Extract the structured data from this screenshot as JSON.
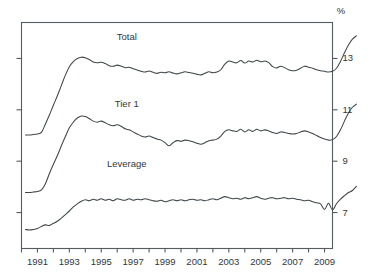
{
  "chart_data": {
    "type": "line",
    "title": "",
    "subtitle": "",
    "xlabel": "",
    "ylabel": "",
    "unit_label": "%",
    "ylim": [
      5.6,
      14.4
    ],
    "xlim": [
      1990.0,
      2009.5
    ],
    "grid": false,
    "legend_position": "inline-annotations",
    "y_ticks": [
      7,
      9,
      11,
      13
    ],
    "y_tick_labels": [
      "7",
      "9",
      "11",
      "13"
    ],
    "y_tick_side": "right",
    "x_ticks": [
      1991,
      1993,
      1995,
      1997,
      1999,
      2001,
      2003,
      2005,
      2007,
      2009
    ],
    "x_tick_labels": [
      "1991",
      "1993",
      "1995",
      "1997",
      "1999",
      "2001",
      "2003",
      "2005",
      "2007",
      "2009"
    ],
    "x_minor_ticks": [
      1990,
      1992,
      1994,
      1996,
      1998,
      2000,
      2002,
      2004,
      2006,
      2008
    ],
    "x_start": 1990.25,
    "x_step": 0.25,
    "series": [
      {
        "name": "Total",
        "label": "Total",
        "label_x": 1996.6,
        "label_y": 13.72,
        "color": "#404448",
        "values": [
          10.02,
          10.02,
          10.04,
          10.06,
          10.12,
          10.45,
          10.8,
          11.18,
          11.55,
          11.95,
          12.35,
          12.68,
          12.88,
          13.0,
          13.05,
          13.03,
          12.96,
          12.86,
          12.83,
          12.85,
          12.8,
          12.72,
          12.7,
          12.74,
          12.7,
          12.64,
          12.66,
          12.6,
          12.55,
          12.5,
          12.47,
          12.51,
          12.46,
          12.42,
          12.46,
          12.44,
          12.48,
          12.43,
          12.4,
          12.44,
          12.48,
          12.45,
          12.42,
          12.38,
          12.36,
          12.42,
          12.48,
          12.44,
          12.47,
          12.56,
          12.78,
          12.9,
          12.86,
          12.83,
          12.92,
          12.82,
          12.9,
          12.86,
          12.93,
          12.87,
          12.9,
          12.84,
          12.68,
          12.63,
          12.7,
          12.64,
          12.56,
          12.52,
          12.54,
          12.62,
          12.7,
          12.66,
          12.62,
          12.56,
          12.52,
          12.5,
          12.47,
          12.5,
          12.62,
          12.88,
          13.22,
          13.52,
          13.75,
          13.88
        ]
      },
      {
        "name": "Tier 1",
        "label": "Tier 1",
        "label_x": 1996.6,
        "label_y": 11.1,
        "color": "#404448",
        "values": [
          7.78,
          7.78,
          7.8,
          7.82,
          7.88,
          8.12,
          8.52,
          8.88,
          9.22,
          9.6,
          9.96,
          10.3,
          10.52,
          10.68,
          10.76,
          10.74,
          10.66,
          10.56,
          10.52,
          10.56,
          10.5,
          10.42,
          10.38,
          10.42,
          10.36,
          10.26,
          10.22,
          10.14,
          10.06,
          9.98,
          9.94,
          9.98,
          9.92,
          9.86,
          9.82,
          9.72,
          9.6,
          9.72,
          9.8,
          9.78,
          9.82,
          9.8,
          9.76,
          9.7,
          9.66,
          9.72,
          9.8,
          9.82,
          9.86,
          9.98,
          10.16,
          10.22,
          10.18,
          10.16,
          10.24,
          10.14,
          10.22,
          10.16,
          10.24,
          10.18,
          10.22,
          10.18,
          10.12,
          10.08,
          10.14,
          10.12,
          10.08,
          10.06,
          10.08,
          10.14,
          10.18,
          10.14,
          10.08,
          10.0,
          9.92,
          9.86,
          9.82,
          9.84,
          9.96,
          10.22,
          10.56,
          10.88,
          11.1,
          11.22
        ]
      },
      {
        "name": "Leverage",
        "label": "Leverage",
        "label_x": 1996.6,
        "label_y": 8.76,
        "color": "#404448",
        "values": [
          6.34,
          6.32,
          6.34,
          6.38,
          6.46,
          6.52,
          6.5,
          6.58,
          6.66,
          6.78,
          6.92,
          7.06,
          7.22,
          7.34,
          7.44,
          7.5,
          7.46,
          7.52,
          7.48,
          7.54,
          7.48,
          7.52,
          7.46,
          7.54,
          7.5,
          7.48,
          7.54,
          7.48,
          7.52,
          7.5,
          7.54,
          7.5,
          7.46,
          7.44,
          7.48,
          7.42,
          7.46,
          7.5,
          7.46,
          7.5,
          7.46,
          7.5,
          7.52,
          7.48,
          7.5,
          7.46,
          7.5,
          7.54,
          7.5,
          7.56,
          7.62,
          7.58,
          7.54,
          7.56,
          7.52,
          7.58,
          7.54,
          7.58,
          7.62,
          7.56,
          7.52,
          7.56,
          7.58,
          7.54,
          7.56,
          7.58,
          7.54,
          7.56,
          7.52,
          7.5,
          7.46,
          7.48,
          7.42,
          7.38,
          7.34,
          7.12,
          7.36,
          7.1,
          7.34,
          7.52,
          7.66,
          7.78,
          7.86,
          8.02
        ]
      }
    ]
  }
}
